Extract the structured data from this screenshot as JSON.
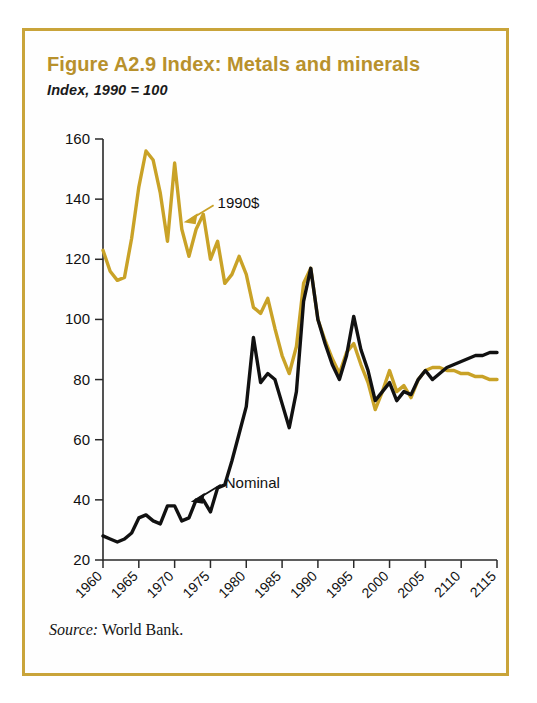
{
  "figure": {
    "title": "Figure A2.9  Index: Metals and minerals",
    "subtitle": "Index, 1990 = 100",
    "source_label": "Source:",
    "source_text": "World Bank.",
    "title_color": "#b8912c",
    "frame_color": "#c9a43a"
  },
  "chart_data": {
    "type": "line",
    "title": "Figure A2.9  Index: Metals and minerals",
    "subtitle": "Index, 1990 = 100",
    "xlabel": "",
    "ylabel": "Index, 1990 = 100",
    "xlim": [
      1960,
      2015
    ],
    "ylim": [
      20,
      160
    ],
    "yticks": [
      20,
      40,
      60,
      80,
      100,
      120,
      140,
      160
    ],
    "xticks": [
      1960,
      1965,
      1970,
      1975,
      1980,
      1985,
      1990,
      1995,
      2000,
      2005,
      2110,
      2115
    ],
    "xtick_labels": [
      "1960",
      "1965",
      "1970",
      "1975",
      "1980",
      "1985",
      "1990",
      "1995",
      "2000",
      "2005",
      "2110",
      "2115"
    ],
    "grid": false,
    "legend": "inline-annotations",
    "annotations": [
      {
        "text": "1990$",
        "series": "1990$",
        "x": 1976,
        "y": 137,
        "color": "#c9a227"
      },
      {
        "text": "Nominal",
        "series": "Nominal",
        "x": 1977,
        "y": 44,
        "color": "#111111"
      }
    ],
    "x": [
      1960,
      1961,
      1962,
      1963,
      1964,
      1965,
      1966,
      1967,
      1968,
      1969,
      1970,
      1971,
      1972,
      1973,
      1974,
      1975,
      1976,
      1977,
      1978,
      1979,
      1980,
      1981,
      1982,
      1983,
      1984,
      1985,
      1986,
      1987,
      1988,
      1989,
      1990,
      1991,
      1992,
      1993,
      1994,
      1995,
      1996,
      1997,
      1998,
      1999,
      2000,
      2001,
      2002,
      2003,
      2004,
      2005,
      2006,
      2007,
      2008,
      2009,
      2010,
      2011,
      2012,
      2013,
      2014,
      2015
    ],
    "series": [
      {
        "name": "1990$",
        "color": "#c9a227",
        "values": [
          123,
          116,
          113,
          114,
          127,
          144,
          156,
          153,
          142,
          126,
          152,
          130,
          121,
          130,
          135,
          120,
          126,
          112,
          115,
          121,
          115,
          104,
          102,
          107,
          97,
          88,
          82,
          91,
          112,
          117,
          100,
          93,
          87,
          82,
          89,
          92,
          85,
          79,
          70,
          76,
          83,
          76,
          78,
          74,
          80,
          83,
          84,
          84,
          83,
          83,
          82,
          82,
          81,
          81,
          80,
          80
        ]
      },
      {
        "name": "Nominal",
        "color": "#111111",
        "values": [
          28,
          27,
          26,
          27,
          29,
          34,
          35,
          33,
          32,
          38,
          38,
          33,
          34,
          40,
          40,
          36,
          44,
          45,
          53,
          62,
          71,
          94,
          79,
          82,
          80,
          72,
          64,
          76,
          106,
          117,
          100,
          92,
          85,
          80,
          88,
          101,
          90,
          83,
          73,
          76,
          79,
          73,
          76,
          75,
          80,
          83,
          80,
          82,
          84,
          85,
          86,
          87,
          88,
          88,
          89,
          89
        ]
      }
    ]
  }
}
